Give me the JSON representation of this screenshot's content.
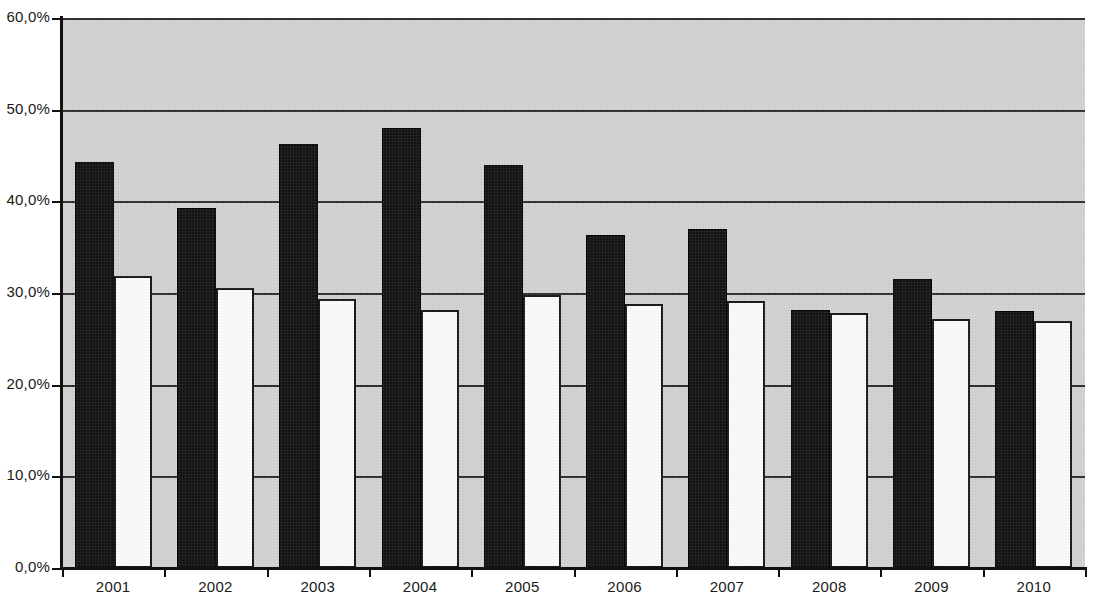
{
  "chart_data": {
    "type": "bar",
    "title": "",
    "subtitle": "",
    "xlabel": "",
    "ylabel": "",
    "categories": [
      "2001",
      "2002",
      "2003",
      "2004",
      "2005",
      "2006",
      "2007",
      "2008",
      "2009",
      "2010"
    ],
    "series": [
      {
        "name": "Series 1",
        "color": "#131313",
        "values": [
          44.3,
          39.3,
          46.3,
          48.0,
          44.0,
          36.3,
          37.0,
          28.1,
          31.5,
          28.0
        ]
      },
      {
        "name": "Series 2",
        "color": "#fbfbfb",
        "values": [
          31.9,
          30.6,
          29.4,
          28.2,
          29.8,
          28.8,
          29.1,
          27.8,
          27.2,
          27.0
        ]
      }
    ],
    "ylim": [
      0,
      60
    ],
    "y_ticks": [
      0,
      10,
      20,
      30,
      40,
      50,
      60
    ],
    "y_tick_labels": [
      "0,0%",
      "10,0%",
      "20,0%",
      "30,0%",
      "40,0%",
      "50,0%",
      "60,0%"
    ],
    "grid": true,
    "grid_axis": "y",
    "legend": "none",
    "legend_position": "none",
    "plot_background": "#d2d2d2",
    "figure_background": "#ffffff",
    "axis_color": "#111111",
    "gridline_color": "#2b2b2b",
    "value_format": "percent-comma-decimal"
  }
}
